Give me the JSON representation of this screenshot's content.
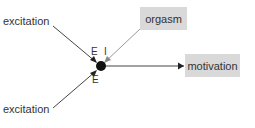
{
  "diagram": {
    "inputs": [
      {
        "label": "excitation",
        "position": "top-left",
        "sign": "E"
      },
      {
        "label": "excitation",
        "position": "bottom-left",
        "sign": "E"
      }
    ],
    "outputs": [
      {
        "label": "orgasm",
        "sign": "I"
      },
      {
        "label": "motivation"
      }
    ],
    "node": {
      "type": "neuron"
    },
    "colors": {
      "box": "#d9d9d9",
      "line": "#555555",
      "node": "#111111"
    }
  }
}
